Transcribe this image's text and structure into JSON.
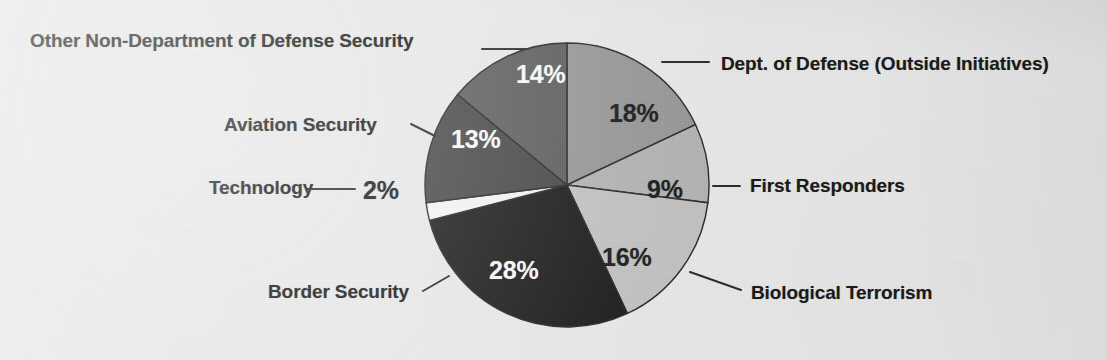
{
  "figure": {
    "background_color": "#ebebeb",
    "label_color": "#181818"
  },
  "chart_data": {
    "type": "pie",
    "title": "",
    "subtitle": "",
    "xlabel": "",
    "ylabel": "",
    "legend_position": "none",
    "grid": false,
    "units": "percent",
    "total": 100,
    "start_angle_deg": 0,
    "direction": "clockwise",
    "categories": [
      "Dept. of Defense (Outside Initiatives)",
      "First Responders",
      "Biological Terrorism",
      "Border Security",
      "Technology",
      "Aviation Security",
      "Other Non-Department of Defense Security"
    ],
    "values": [
      18,
      9,
      16,
      28,
      2,
      13,
      14
    ],
    "value_labels": [
      "18%",
      "9%",
      "16%",
      "28%",
      "2%",
      "13%",
      "14%"
    ],
    "colors": [
      "#999999",
      "#b5b5b5",
      "#c4c4c4",
      "#1a1a1a",
      "#f7f7f7",
      "#4a4a4a",
      "#5e5e5e"
    ],
    "slices": [
      {
        "label": "Dept. of Defense (Outside Initiatives)",
        "value": 18,
        "value_label": "18%",
        "color": "#999999",
        "label_text_color": "#1b1b1b"
      },
      {
        "label": "First Responders",
        "value": 9,
        "value_label": "9%",
        "color": "#b5b5b5",
        "label_text_color": "#1b1b1b"
      },
      {
        "label": "Biological Terrorism",
        "value": 16,
        "value_label": "16%",
        "color": "#c4c4c4",
        "label_text_color": "#1b1b1b"
      },
      {
        "label": "Border Security",
        "value": 28,
        "value_label": "28%",
        "color": "#1a1a1a",
        "label_text_color": "#fbfbfb"
      },
      {
        "label": "Technology",
        "value": 2,
        "value_label": "2%",
        "color": "#f7f7f7",
        "label_text_color": "#1b1b1b"
      },
      {
        "label": "Aviation Security",
        "value": 13,
        "value_label": "13%",
        "color": "#4a4a4a",
        "label_text_color": "#fbfbfb"
      },
      {
        "label": "Other Non-Department of Defense Security",
        "value": 14,
        "value_label": "14%",
        "color": "#5e5e5e",
        "label_text_color": "#fbfbfb"
      }
    ]
  },
  "labels": {
    "other_non_dod": "Other Non-Department of Defense Security",
    "aviation": "Aviation Security",
    "technology": "Technology",
    "border": "Border Security",
    "dod_outside": "Dept. of Defense (Outside Initiatives)",
    "first_responders": "First Responders",
    "bio_terrorism": "Biological Terrorism"
  },
  "percents": {
    "other_non_dod": "14%",
    "aviation": "13%",
    "technology": "2%",
    "border": "28%",
    "dod_outside": "18%",
    "first_responders": "9%",
    "bio_terrorism": "16%"
  }
}
